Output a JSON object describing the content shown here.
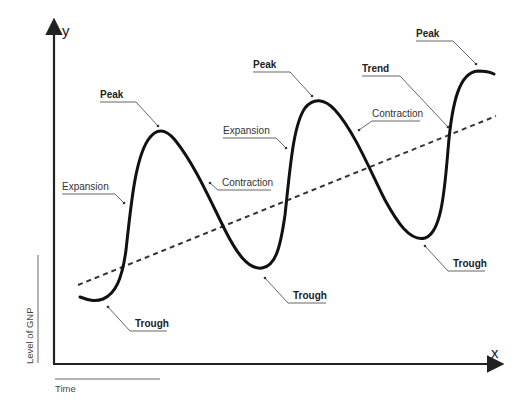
{
  "diagram": {
    "axes": {
      "y_letter": "y",
      "x_letter": "x",
      "y_label": "Level of GNP",
      "x_label": "Time"
    },
    "annotations": {
      "peak_1": "Peak",
      "peak_2": "Peak",
      "peak_3": "Peak",
      "trough_1": "Trough",
      "trough_2": "Trough",
      "trough_3": "Trough",
      "expansion_1": "Expansion",
      "expansion_2": "Expansion",
      "contraction_1": "Contraction",
      "contraction_2": "Contraction",
      "trend": "Trend"
    },
    "colors": {
      "curve": "#111111",
      "trend": "#333333",
      "leader": "#555555",
      "axis": "#222222"
    }
  }
}
